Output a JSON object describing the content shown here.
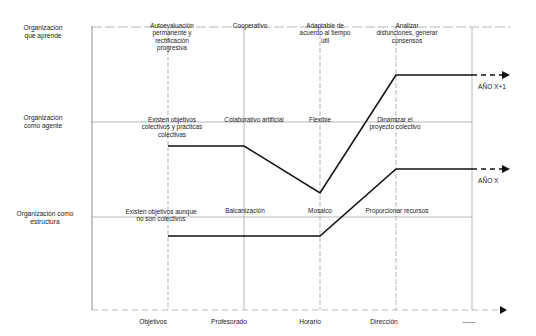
{
  "diagram": {
    "rows": [
      {
        "id": "aprende",
        "label_lines": [
          "Organización",
          "que aprende"
        ]
      },
      {
        "id": "agente",
        "label_lines": [
          "Organización",
          "como agente"
        ]
      },
      {
        "id": "estructura",
        "label_lines": [
          "Organización como",
          "estructura"
        ]
      }
    ],
    "columns": [
      "Objetivos",
      "Profesorado",
      "Horario",
      "Dirección",
      "------"
    ],
    "cells": {
      "aprende": [
        [
          "Autoevaluación",
          "permanente y",
          "rectificación",
          "progresiva"
        ],
        [
          "Cooperativo"
        ],
        [
          "Adaptable de",
          "acuerdo al tiempo",
          "útil"
        ],
        [
          "Analizar",
          "disfunciones, generar",
          "consensos"
        ]
      ],
      "agente": [
        [
          "Existen objetivos",
          "colectivos y prácticas",
          "colectivas"
        ],
        [
          "Colaborativo artificial"
        ],
        [
          "Flexible"
        ],
        [
          "Dinamizar el",
          "proyecto colectivo"
        ]
      ],
      "estructura": [
        [
          "Existen objetivos aunque",
          "no son colectivos"
        ],
        [
          "Balcanización"
        ],
        [
          "Mosaico"
        ],
        [
          "Proporcionar recursos"
        ]
      ]
    },
    "series": [
      {
        "name": "AÑO X+1",
        "points": [
          [
            "Objetivos",
            "agente"
          ],
          [
            "Profesorado",
            "agente"
          ],
          [
            "Horario",
            "below agente"
          ],
          [
            "Dirección",
            "aprende"
          ],
          [
            "------",
            "aprende"
          ]
        ]
      },
      {
        "name": "AÑO X",
        "points": [
          [
            "Objetivos",
            "estructura"
          ],
          [
            "Profesorado",
            "estructura"
          ],
          [
            "Horario",
            "estructura"
          ],
          [
            "Dirección",
            "above estructura"
          ],
          [
            "------",
            "above estructura"
          ]
        ]
      }
    ]
  },
  "labels": {
    "row_aprende_1": "Organización",
    "row_aprende_2": "que aprende",
    "row_agente_1": "Organización",
    "row_agente_2": "como agente",
    "row_estructura_1": "Organización como",
    "row_estructura_2": "estructura",
    "c_ap_obj_1": "Autoevaluación",
    "c_ap_obj_2": "permanente y",
    "c_ap_obj_3": "rectificación",
    "c_ap_obj_4": "progresiva",
    "c_ap_prof": "Cooperativo",
    "c_ap_hor_1": "Adaptable de",
    "c_ap_hor_2": "acuerdo al tiempo",
    "c_ap_hor_3": "útil",
    "c_ap_dir_1": "Analizar",
    "c_ap_dir_2": "disfunciones, generar",
    "c_ap_dir_3": "consensos",
    "c_ag_obj_1": "Existen objetivos",
    "c_ag_obj_2": "colectivos y prácticas",
    "c_ag_obj_3": "colectivas",
    "c_ag_prof": "Colaborativo artificial",
    "c_ag_hor": "Flexible",
    "c_ag_dir_1": "Dinamizar el",
    "c_ag_dir_2": "proyecto colectivo",
    "c_es_obj_1": "Existen objetivos aunque",
    "c_es_obj_2": "no son colectivos",
    "c_es_prof": "Balcanización",
    "c_es_hor": "Mosaico",
    "c_es_dir": "Proporcionar recursos",
    "x_obj": "Objetivos",
    "x_prof": "Profesorado",
    "x_hor": "Horario",
    "x_dir": "Dirección",
    "x_more": "------",
    "year_next": "AÑO X+1",
    "year_curr": "AÑO X"
  },
  "colors": {
    "line": "#111111",
    "grid": "#9a9a9a",
    "text": "#1a1a1a"
  }
}
